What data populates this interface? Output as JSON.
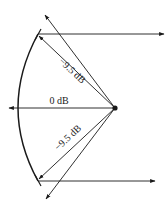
{
  "diagram": {
    "type": "beam-pattern",
    "labels": {
      "upper": "−9.5 dB",
      "center": "0 dB",
      "lower": "−9.5 dB"
    },
    "colors": {
      "stroke": "#1a1a1a",
      "background": "#ffffff"
    }
  }
}
